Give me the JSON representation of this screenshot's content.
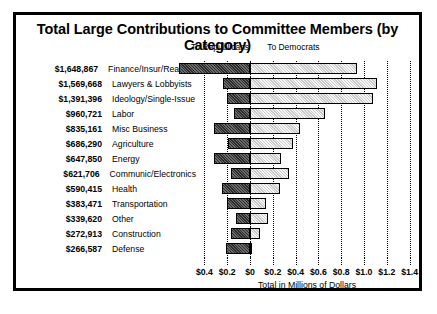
{
  "chart_data": {
    "type": "bar",
    "orientation": "horizontal",
    "title": "Total Large Contributions to Committee Members (by Category)",
    "subtitle": "",
    "xlabel": "Total in Millions of Dollars",
    "ylabel": "",
    "xlim": [
      -0.5,
      1.5
    ],
    "grid": true,
    "legend_position": "top",
    "axis_note": "Left of zero = To Republicans, right of zero = To Democrats",
    "legend": [
      {
        "label": "To Republicans",
        "name": "republicans",
        "color": "#2b2b2b"
      },
      {
        "label": "To Democrats",
        "name": "democrats",
        "color": "#c9c9c9"
      }
    ],
    "xticks": [
      {
        "value": -0.4,
        "label": "$0.4"
      },
      {
        "value": -0.2,
        "label": "$0.2"
      },
      {
        "value": 0.0,
        "label": "$0"
      },
      {
        "value": 0.2,
        "label": "$0.2"
      },
      {
        "value": 0.4,
        "label": "$0.4"
      },
      {
        "value": 0.6,
        "label": "$0.6"
      },
      {
        "value": 0.8,
        "label": "$0.8"
      },
      {
        "value": 1.0,
        "label": "$1.0"
      },
      {
        "value": 1.2,
        "label": "$1.2"
      },
      {
        "value": 1.4,
        "label": "$1.4"
      }
    ],
    "categories": [
      "Finance/Insur/Real Est",
      "Lawyers & Lobbyists",
      "Ideology/Single-Issue",
      "Labor",
      "Misc Business",
      "Agriculture",
      "Energy",
      "Communic/Electronics",
      "Health",
      "Transportation",
      "Other",
      "Construction",
      "Defense"
    ],
    "totals": [
      "$1,648,867",
      "$1,569,668",
      "$1,391,396",
      "$960,721",
      "$835,161",
      "$686,290",
      "$647,850",
      "$621,706",
      "$590,415",
      "$383,471",
      "$339,620",
      "$272,913",
      "$266,587"
    ],
    "series": [
      {
        "name": "To Republicans",
        "values": [
          0.62,
          0.24,
          0.2,
          0.14,
          0.32,
          0.19,
          0.32,
          0.17,
          0.25,
          0.2,
          0.12,
          0.17,
          0.21
        ]
      },
      {
        "name": "To Democrats",
        "values": [
          0.94,
          1.11,
          1.08,
          0.66,
          0.44,
          0.38,
          0.27,
          0.34,
          0.26,
          0.14,
          0.16,
          0.09,
          0.02
        ]
      }
    ],
    "rows": [
      {
        "category": "Finance/Insur/Real Est",
        "total": "$1,648,867",
        "republicans": 0.62,
        "democrats": 0.94
      },
      {
        "category": "Lawyers & Lobbyists",
        "total": "$1,569,668",
        "republicans": 0.24,
        "democrats": 1.11
      },
      {
        "category": "Ideology/Single-Issue",
        "total": "$1,391,396",
        "republicans": 0.2,
        "democrats": 1.08
      },
      {
        "category": "Labor",
        "total": "$960,721",
        "republicans": 0.14,
        "democrats": 0.66
      },
      {
        "category": "Misc Business",
        "total": "$835,161",
        "republicans": 0.32,
        "democrats": 0.44
      },
      {
        "category": "Agriculture",
        "total": "$686,290",
        "republicans": 0.19,
        "democrats": 0.38
      },
      {
        "category": "Energy",
        "total": "$647,850",
        "republicans": 0.32,
        "democrats": 0.27
      },
      {
        "category": "Communic/Electronics",
        "total": "$621,706",
        "republicans": 0.17,
        "democrats": 0.34
      },
      {
        "category": "Health",
        "total": "$590,415",
        "republicans": 0.25,
        "democrats": 0.26
      },
      {
        "category": "Transportation",
        "total": "$383,471",
        "republicans": 0.2,
        "democrats": 0.14
      },
      {
        "category": "Other",
        "total": "$339,620",
        "republicans": 0.12,
        "democrats": 0.16
      },
      {
        "category": "Construction",
        "total": "$272,913",
        "republicans": 0.17,
        "democrats": 0.09
      },
      {
        "category": "Defense",
        "total": "$266,587",
        "republicans": 0.21,
        "democrats": 0.02
      }
    ]
  }
}
